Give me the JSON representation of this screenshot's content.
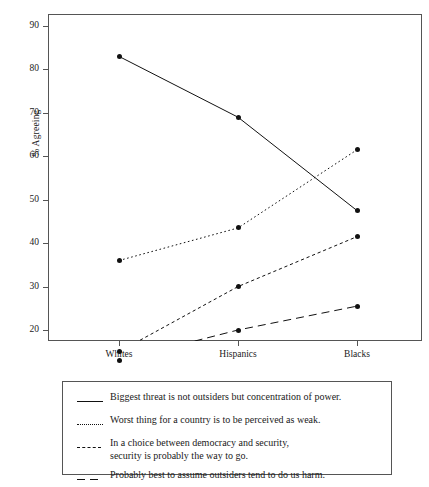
{
  "chart_data": {
    "type": "line",
    "title": "",
    "subtitle": "",
    "xlabel": "",
    "ylabel": "% Agreeing",
    "categories": [
      "Whites",
      "Hispanics",
      "Blacks"
    ],
    "yticks": [
      20,
      30,
      40,
      50,
      60,
      70,
      80,
      90
    ],
    "ylim": [
      11,
      93
    ],
    "grid": false,
    "legend_position": "below-plot",
    "series": [
      {
        "name": "Biggest threat is not outsiders but concentration of power.",
        "style": "solid",
        "marker": "filled-circle",
        "color": "#111111",
        "values": [
          83,
          69,
          47.5
        ]
      },
      {
        "name": "Worst thing for a country is to be perceived as weak.",
        "style": "dotted",
        "marker": "filled-circle",
        "color": "#111111",
        "values": [
          36,
          43.5,
          61.5
        ]
      },
      {
        "name": "In a choice between democracy and security,\nsecurity is probably the way to go.",
        "style": "dashed-fine",
        "marker": "filled-circle",
        "color": "#111111",
        "values": [
          15,
          30,
          41.5
        ]
      },
      {
        "name": "Probably best to assume outsiders tend to do us harm.",
        "style": "dashed-long",
        "marker": "filled-circle",
        "color": "#111111",
        "values": [
          13,
          20,
          25.5
        ]
      }
    ]
  },
  "legend": {
    "entries": [
      {
        "label": "Biggest threat is not outsiders but concentration of power.",
        "swatch": "solid-line-swatch"
      },
      {
        "label": "Worst thing for a country is to be perceived as weak.",
        "swatch": "dotted-line-swatch"
      },
      {
        "label": "In a choice between democracy and security,\nsecurity is probably the way to go.",
        "swatch": "fine-dashed-line-swatch"
      },
      {
        "label": "Probably best to assume outsiders tend to do us harm.",
        "swatch": "long-dashed-line-swatch"
      }
    ]
  }
}
